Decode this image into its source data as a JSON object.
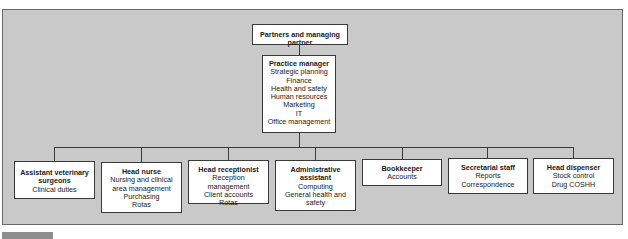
{
  "chart": {
    "top": {
      "title": "Partners and managing partner"
    },
    "manager": {
      "title": "Practice manager",
      "duties": [
        "Strategic planning",
        "Finance",
        "Health and safety",
        "Human resources",
        "Marketing",
        "IT",
        "Office management"
      ]
    },
    "staff": [
      {
        "title": "Assistant veterinary surgeons",
        "duties": [
          "Clinical duties"
        ]
      },
      {
        "title": "Head nurse",
        "duties": [
          "Nursing and clinical area management",
          "Purchasing",
          "Rotas"
        ]
      },
      {
        "title": "Head receptionist",
        "duties": [
          "Reception management",
          "Client accounts",
          "Rotas"
        ]
      },
      {
        "title": "Administrative assistant",
        "duties": [
          "Computing",
          "General health and safety"
        ]
      },
      {
        "title": "Bookkeeper",
        "duties": [
          "Accounts"
        ]
      },
      {
        "title": "Secretarial staff",
        "duties": [
          "Reports",
          "Correspondence"
        ]
      },
      {
        "title": "Head dispenser",
        "duties": [
          "Stock control",
          "Drug COSHH"
        ]
      }
    ]
  }
}
